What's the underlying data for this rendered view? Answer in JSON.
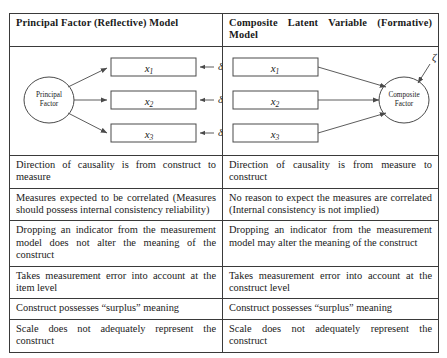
{
  "table": {
    "headers": {
      "left": "Principal Factor (Reflective) Model",
      "right": "Composite Latent Variable (Formative) Model"
    },
    "rows": [
      {
        "left": "Direction of causality is from construct to measure",
        "right": "Direction of causality is from measure to construct"
      },
      {
        "left": "Measures expected to be correlated (Measures should possess internal consistency reliability)",
        "right": "No reason to expect the measures are correlated (Internal consistency is not implied)"
      },
      {
        "left": "Dropping an indicator from the measurement model does not alter the meaning of the construct",
        "right": "Dropping an indicator from the measurement model may alter the meaning of the construct"
      },
      {
        "left": "Takes measurement error into account at the item level",
        "right": "Takes measurement error into account at the construct level"
      },
      {
        "left": "Construct possesses “surplus” meaning",
        "right": "Construct possesses “surplus” meaning"
      },
      {
        "left": "Scale does not adequately represent the construct",
        "right": "Scale does not adequately represent the construct"
      }
    ]
  },
  "reflective_diagram": {
    "factor_label_line1": "Principal",
    "factor_label_line2": "Factor",
    "indicators": [
      "x",
      "x",
      "x"
    ],
    "indicator_subscripts": [
      "1",
      "2",
      "3"
    ],
    "errors": [
      "δ",
      "δ",
      "δ"
    ],
    "error_subscripts": [
      "1",
      "2",
      "3"
    ]
  },
  "formative_diagram": {
    "factor_label_line1": "Composite",
    "factor_label_line2": "Factor",
    "indicators": [
      "x",
      "x",
      "x"
    ],
    "indicator_subscripts": [
      "1",
      "2",
      "3"
    ],
    "disturbance": "ζ"
  },
  "colors": {
    "border": "#3a3a3a",
    "outer_border": "#2b2b2b",
    "stroke": "#4a4a4a",
    "text": "#1a1a1a",
    "background": "#ffffff"
  }
}
